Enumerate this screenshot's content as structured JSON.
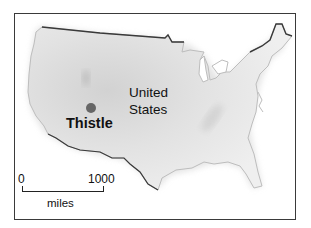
{
  "map": {
    "country_label": [
      "United",
      "States"
    ],
    "city": {
      "name": "Thistle",
      "marker_color": "#666666"
    },
    "scale": {
      "start": "0",
      "end": "1000",
      "units": "miles"
    },
    "colors": {
      "land": "#e4e4e4",
      "land_shadow": "#c8c8c8",
      "border": "#3a3a3a",
      "coast": "#bdbdbd"
    }
  }
}
